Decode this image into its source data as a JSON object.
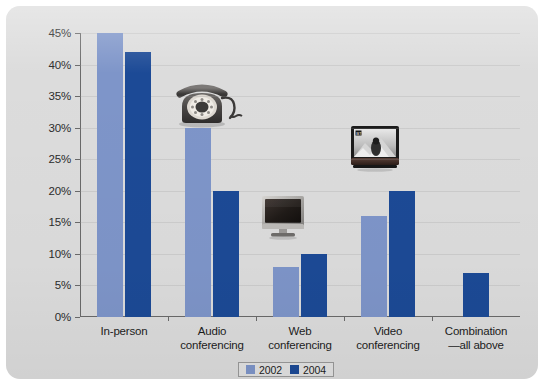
{
  "chart_data": {
    "type": "bar",
    "title": "",
    "xlabel": "",
    "ylabel": "",
    "categories": [
      "In-person",
      "Audio conferencing",
      "Web conferencing",
      "Video conferencing",
      "Combination—all above"
    ],
    "category_lines": [
      [
        "In-person"
      ],
      [
        "Audio",
        "conferencing"
      ],
      [
        "Web",
        "conferencing"
      ],
      [
        "Video",
        "conferencing"
      ],
      [
        "Combination",
        "—all above"
      ]
    ],
    "series": [
      {
        "name": "2002",
        "color": "#7e95c9",
        "values": [
          45,
          30,
          8,
          16,
          null
        ]
      },
      {
        "name": "2004",
        "color": "#1c4a96",
        "values": [
          42,
          20,
          10,
          20,
          7
        ]
      }
    ],
    "ylim": [
      0,
      45
    ],
    "ytick_values": [
      0,
      5,
      10,
      15,
      20,
      25,
      30,
      35,
      40,
      45
    ],
    "ytick_labels": [
      "0%",
      "5%",
      "10%",
      "15%",
      "20%",
      "25%",
      "30%",
      "35%",
      "40%",
      "45%"
    ],
    "grid": true,
    "legend_position": "bottom-center"
  },
  "legend": {
    "entries": [
      {
        "label": "2002",
        "color": "#7e95c9"
      },
      {
        "label": "2004",
        "color": "#1c4a96"
      }
    ]
  },
  "photos": [
    {
      "name": "rotary-telephone",
      "caption": "rotary telephone"
    },
    {
      "name": "flat-panel-monitor",
      "caption": "flat panel computer monitor"
    },
    {
      "name": "television",
      "caption": "television displaying a person"
    }
  ],
  "colors": {
    "panel_background": "#dcdcdc",
    "series_2002": "#7e95c9",
    "series_2004": "#1c4a96",
    "axis": "#6a6a6a",
    "text": "#1d1d1d"
  }
}
